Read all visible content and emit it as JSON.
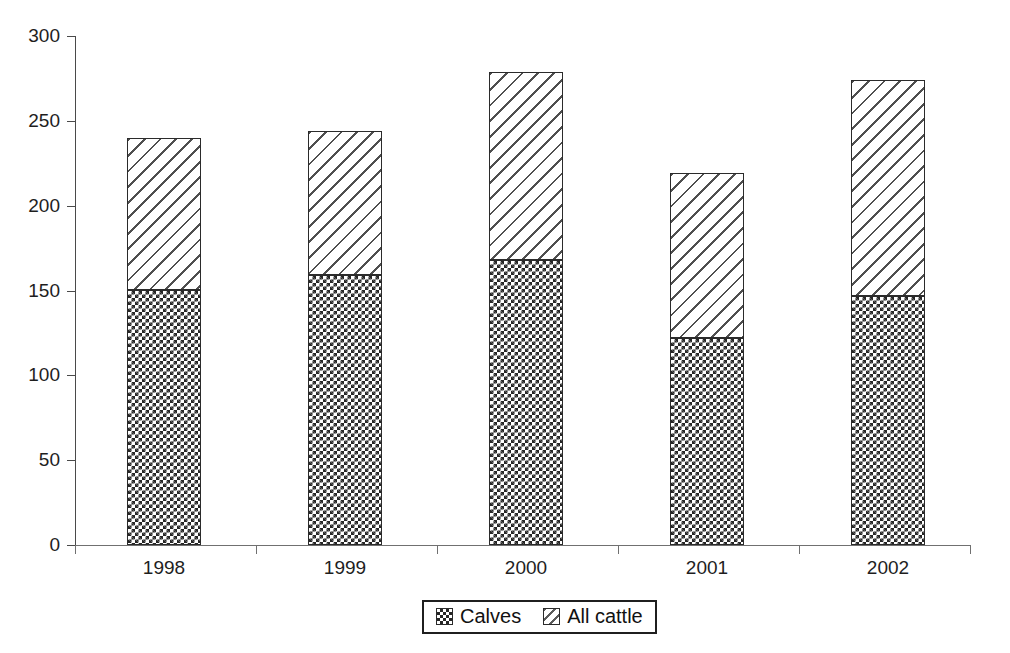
{
  "chart_data": {
    "type": "bar",
    "subtype": "stacked-vertical",
    "title": "",
    "xlabel": "",
    "ylabel": "",
    "categories": [
      "1998",
      "1999",
      "2000",
      "2001",
      "2002"
    ],
    "series": [
      {
        "name": "Calves",
        "pattern": "checkerboard",
        "values": [
          150,
          159,
          168,
          122,
          147
        ]
      },
      {
        "name": "All cattle",
        "pattern": "diagonal-hatch",
        "values": [
          90,
          85,
          111,
          97,
          127
        ]
      }
    ],
    "stack_totals": [
      240,
      244,
      279,
      219,
      274
    ],
    "ylim": [
      0,
      300
    ],
    "yticks": [
      0,
      50,
      100,
      150,
      200,
      250,
      300
    ],
    "ytick_labels": [
      "0",
      "50",
      "100",
      "150",
      "200",
      "250",
      "300"
    ],
    "grid": false,
    "legend_position": "bottom-center",
    "legend_entries": [
      "Calves",
      "All cattle"
    ],
    "colors": {
      "axis": "#4a4a4a",
      "bar_outline": "#2b2b2b",
      "calves_pattern": "#262626",
      "all_cattle_pattern": "#4f4f4f",
      "background": "#ffffff",
      "text": "#1e1e1e"
    }
  },
  "legend": {
    "items": [
      {
        "label": "Calves",
        "swatch": "checkerboard-swatch-icon"
      },
      {
        "label": "All cattle",
        "swatch": "diagonal-hatch-swatch-icon"
      }
    ]
  }
}
